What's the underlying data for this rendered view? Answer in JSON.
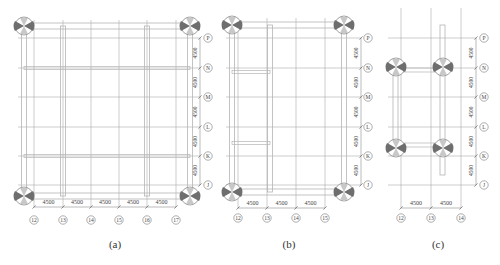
{
  "figure": {
    "panels": [
      {
        "id": "a",
        "caption": "(a)",
        "column_axes": [
          "12",
          "13",
          "14",
          "15",
          "16",
          "17"
        ],
        "column_spacings": [
          "4500",
          "4500",
          "4500",
          "4500",
          "4500"
        ],
        "row_axes": [
          "P",
          "N",
          "M",
          "L",
          "K",
          "J"
        ],
        "row_spacings": [
          "4500",
          "4500",
          "4500",
          "4500",
          "4500"
        ],
        "supports": 4
      },
      {
        "id": "b",
        "caption": "(b)",
        "column_axes": [
          "12",
          "13",
          "14",
          "15"
        ],
        "column_spacings": [
          "4500",
          "4500",
          "4500"
        ],
        "row_axes": [
          "P",
          "N",
          "M",
          "L",
          "K",
          "J"
        ],
        "row_spacings": [
          "4500",
          "4500",
          "4500",
          "4500",
          "4500"
        ],
        "supports": 4
      },
      {
        "id": "c",
        "caption": "(c)",
        "column_axes": [
          "12",
          "13",
          "14"
        ],
        "column_spacings": [
          "4500",
          "4500"
        ],
        "row_axes": [
          "P",
          "N",
          "M",
          "L",
          "K",
          "J"
        ],
        "row_spacings": [
          "4500",
          "4500",
          "4500",
          "4500",
          "4500"
        ],
        "supports": 4
      }
    ],
    "colors": {
      "grid_line": "#9a9a9a",
      "member": "#b5b5b5",
      "support_fill": "#6e6e6e",
      "text": "#444444"
    }
  }
}
